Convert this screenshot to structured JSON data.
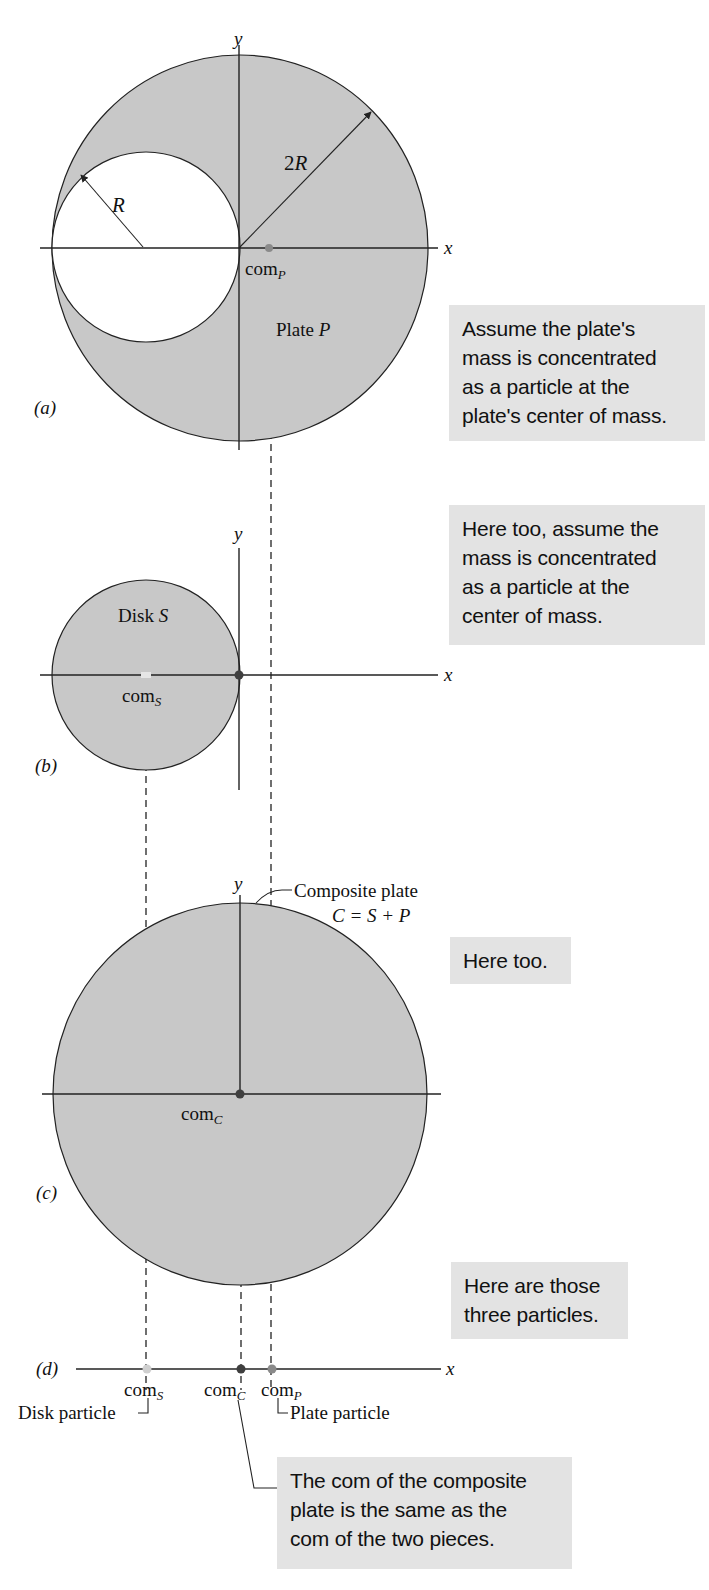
{
  "figure": {
    "panels": {
      "a": {
        "label": "(a)",
        "axis_x": "x",
        "axis_y": "y",
        "outer_radius_label": "2R",
        "inner_radius_label": "R",
        "com_label": "com",
        "com_sub": "P",
        "plate_label": "Plate",
        "plate_var": "P"
      },
      "b": {
        "label": "(b)",
        "axis_x": "x",
        "axis_y": "y",
        "disk_label": "Disk",
        "disk_var": "S",
        "com_label": "com",
        "com_sub": "S"
      },
      "c": {
        "label": "(c)",
        "axis_x": "x",
        "axis_y": "y",
        "composite_label": "Composite plate",
        "composite_eq": "C = S + P",
        "com_label": "com",
        "com_sub": "C"
      },
      "d": {
        "label": "(d)",
        "axis_x": "x",
        "com_s_label": "com",
        "com_s_sub": "S",
        "com_c_label": "com",
        "com_c_sub": "C",
        "com_p_label": "com",
        "com_p_sub": "P",
        "disk_particle": "Disk particle",
        "plate_particle": "Plate particle"
      }
    },
    "colors": {
      "shade": "#c8c8c8",
      "line": "#222222",
      "callout_bg": "#e3e3e3",
      "particle_s": "#cfcfcf",
      "particle_c": "#3f3f3f",
      "particle_p": "#8a8a8a"
    }
  },
  "callouts": [
    {
      "lines": [
        "Assume the plate's",
        "mass is concentrated",
        "as a particle at the",
        "plate's center of mass."
      ]
    },
    {
      "lines": [
        "Here too, assume the",
        "mass is concentrated",
        "as a particle at the",
        "center of mass."
      ]
    },
    {
      "lines": [
        "Here too."
      ]
    },
    {
      "lines": [
        "Here are those",
        "three particles."
      ]
    },
    {
      "lines": [
        "The com of the composite",
        "plate is the same as the",
        "com of the two pieces."
      ]
    }
  ]
}
